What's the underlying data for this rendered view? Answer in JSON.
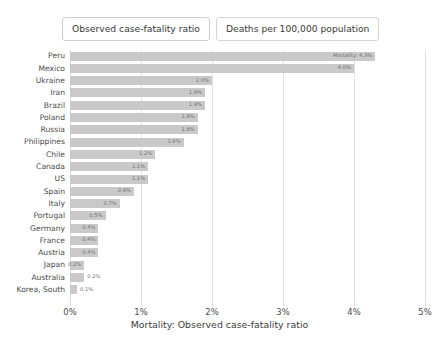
{
  "tabs": [
    {
      "label": "Observed case-fatality ratio",
      "selected": true
    },
    {
      "label": "Deaths per 100,000 population",
      "selected": false
    }
  ],
  "chart_data": {
    "type": "bar",
    "orientation": "horizontal",
    "title": "",
    "xlabel": "Mortality: Observed case-fatality ratio",
    "ylabel": "",
    "xlim": [
      0,
      5
    ],
    "xticks": [
      0,
      1,
      2,
      3,
      4,
      5
    ],
    "xticklabels": [
      "0%",
      "1%",
      "2%",
      "3%",
      "4%",
      "5%"
    ],
    "grid": true,
    "legend": false,
    "bar_color": "#c9c9c9",
    "annotation": "Mortality: 4.3%",
    "categories": [
      "Peru",
      "Mexico",
      "Ukraine",
      "Iran",
      "Brazil",
      "Poland",
      "Russia",
      "Philippines",
      "Chile",
      "Canada",
      "US",
      "Spain",
      "Italy",
      "Portugal",
      "Germany",
      "France",
      "Austria",
      "Japan",
      "Australia",
      "Korea, South"
    ],
    "values": [
      4.3,
      4.0,
      2.0,
      1.9,
      1.9,
      1.8,
      1.8,
      1.6,
      1.2,
      1.1,
      1.1,
      0.9,
      0.7,
      0.5,
      0.4,
      0.4,
      0.4,
      0.2,
      0.2,
      0.1
    ],
    "value_labels": [
      "Mortality: 4.3%",
      "4.0%",
      "2.0%",
      "1.9%",
      "1.9%",
      "1.8%",
      "1.8%",
      "1.6%",
      "1.2%",
      "1.1%",
      "1.1%",
      "0.9%",
      "0.7%",
      "0.5%",
      "0.4%",
      "0.4%",
      "0.4%",
      "0.2%",
      "0.2%",
      "0.1%"
    ],
    "label_placement": [
      "inside",
      "inside",
      "inside",
      "inside",
      "inside",
      "inside",
      "inside",
      "inside",
      "inside",
      "inside",
      "inside",
      "inside",
      "inside",
      "inside",
      "inside",
      "inside",
      "inside",
      "inside",
      "outside",
      "outside"
    ]
  }
}
